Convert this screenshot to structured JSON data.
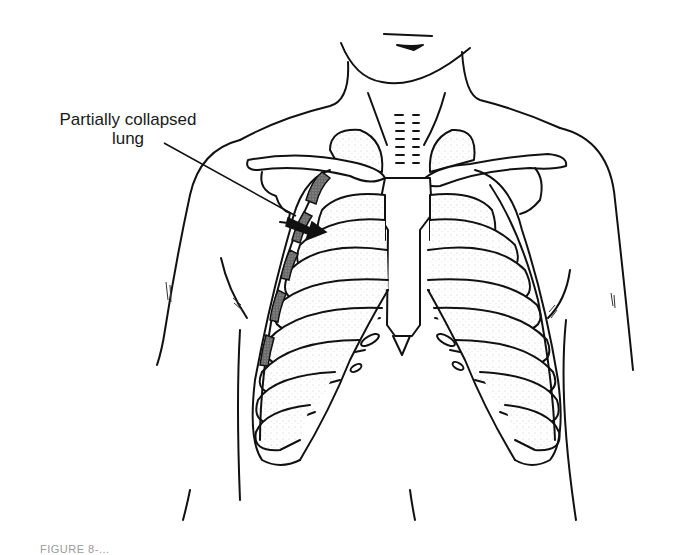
{
  "figure": {
    "label": {
      "line1": "Partially collapsed",
      "line2": "lung"
    },
    "caption": "FIGURE 8-..."
  },
  "colors": {
    "line": "#111111",
    "stipple": "#9a9a9a",
    "collapsed_fill": "#555555",
    "background": "#ffffff"
  }
}
